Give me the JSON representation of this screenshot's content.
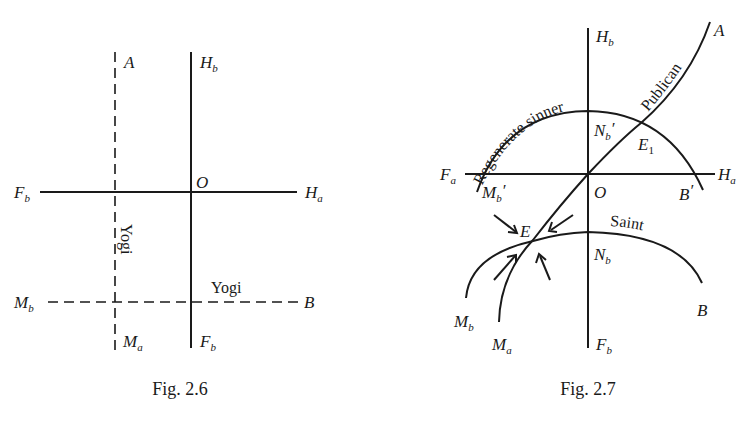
{
  "figures": [
    {
      "id": "fig-2-6",
      "caption": "Fig. 2.6",
      "labels": {
        "A": {
          "base": "A",
          "sub": ""
        },
        "Hb_top": {
          "base": "H",
          "sub": "b"
        },
        "O": {
          "base": "O",
          "sub": ""
        },
        "Fb_left": {
          "base": "F",
          "sub": "b"
        },
        "Ha": {
          "base": "H",
          "sub": "a"
        },
        "Mb": {
          "base": "M",
          "sub": "b"
        },
        "B": {
          "base": "B",
          "sub": ""
        },
        "Ma": {
          "base": "M",
          "sub": "a"
        },
        "Fb_bottom": {
          "base": "F",
          "sub": "b"
        }
      },
      "curve_labels": {
        "yogi_vertical": "Yogi",
        "yogi_horizontal": "Yogi"
      }
    },
    {
      "id": "fig-2-7",
      "caption": "Fig. 2.7",
      "labels": {
        "Hb": {
          "base": "H",
          "sub": "b"
        },
        "A": {
          "base": "A",
          "sub": ""
        },
        "Nb_prime": {
          "base": "N",
          "sub": "b",
          "prime": "′"
        },
        "E1": {
          "base": "E",
          "sub": "1"
        },
        "Fa": {
          "base": "F",
          "sub": "a"
        },
        "Ha": {
          "base": "H",
          "sub": "a"
        },
        "Mb_prime": {
          "base": "M",
          "sub": "b",
          "prime": "′"
        },
        "O": {
          "base": "O",
          "sub": ""
        },
        "B_prime": {
          "base": "B",
          "sub": "",
          "prime": "′"
        },
        "E": {
          "base": "E",
          "sub": ""
        },
        "Nb": {
          "base": "N",
          "sub": "b"
        },
        "Mb": {
          "base": "M",
          "sub": "b"
        },
        "Ma": {
          "base": "M",
          "sub": "a"
        },
        "Fb": {
          "base": "F",
          "sub": "b"
        },
        "B": {
          "base": "B",
          "sub": ""
        }
      },
      "curve_labels": {
        "regenerate": "Regenerate sinner",
        "publican": "Publican",
        "saint": "Saint"
      }
    }
  ]
}
